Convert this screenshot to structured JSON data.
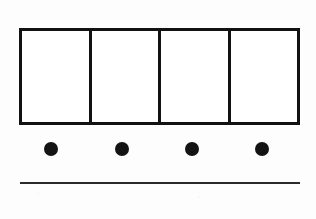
{
  "figure": {
    "background_color": "#fdfdfd",
    "ink_color": "#121212"
  },
  "bar_model": {
    "name": "bar-model",
    "cell_count": 4,
    "cells": [
      {
        "label": "",
        "index": 1
      },
      {
        "label": "",
        "index": 2
      },
      {
        "label": "",
        "index": 3
      },
      {
        "label": "",
        "index": 4
      }
    ],
    "border_color": "#121212",
    "border_width": 3,
    "fill_color": "#ffffff"
  },
  "counters": {
    "name": "counter-row",
    "count": 4,
    "shape": "filled-circle",
    "color": "#131313",
    "diameter": 14,
    "items": [
      {
        "index": 1,
        "label": ""
      },
      {
        "index": 2,
        "label": ""
      },
      {
        "index": 3,
        "label": ""
      },
      {
        "index": 4,
        "label": ""
      }
    ]
  },
  "baseline": {
    "name": "baseline-rule",
    "color": "#2a2a2a",
    "thickness": 2
  }
}
